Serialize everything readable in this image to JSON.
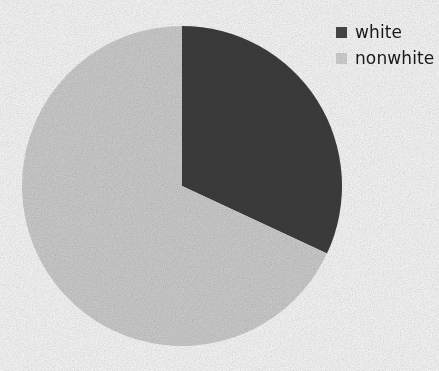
{
  "chart_data": {
    "type": "pie",
    "title": "",
    "categories": [
      "white",
      "nonwhite"
    ],
    "values": [
      32,
      68
    ],
    "unit": "percent",
    "start_angle_deg": 0,
    "direction": "clockwise",
    "slices": [
      {
        "label": "white",
        "value": 32,
        "angle_deg": 115,
        "color": "#3f3f3f"
      },
      {
        "label": "nonwhite",
        "value": 68,
        "angle_deg": 245,
        "color": "#d3d3d3"
      }
    ],
    "legend_position": "top-right",
    "grid": false,
    "xlabel": "",
    "ylabel": ""
  },
  "legend": {
    "items": [
      {
        "label": "white",
        "color": "#4a4a4a"
      },
      {
        "label": "nonwhite",
        "color": "#d8d8d8"
      }
    ]
  },
  "colors": {
    "background": "#ffffff",
    "slice_white": "#3f3f3f",
    "slice_nonwhite": "#d3d3d3",
    "text": "#1a1a1a"
  }
}
